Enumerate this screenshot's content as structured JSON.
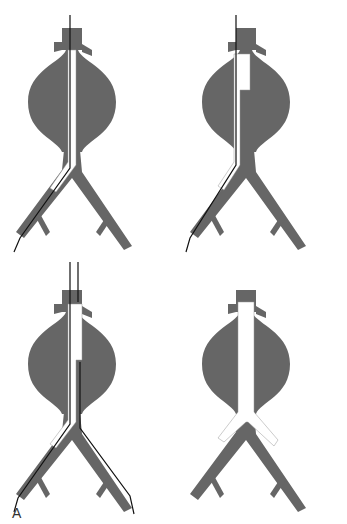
{
  "figure": {
    "label": "A",
    "panels": [
      {
        "id": "step-1",
        "description": "Guidewire and stent-graft main body inserted through right iliac"
      },
      {
        "id": "step-2",
        "description": "Main body deployed with contralateral gate; second guidewire"
      },
      {
        "id": "step-3",
        "description": "Contralateral wire through gate and left iliac"
      },
      {
        "id": "step-4",
        "description": "Completed bifurcated endograft"
      }
    ],
    "colors": {
      "vessel": "#666666",
      "graft": "#ffffff",
      "wire": "#111111",
      "ring": "#999999"
    }
  }
}
